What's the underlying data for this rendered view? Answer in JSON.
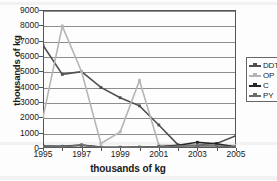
{
  "chart_data": {
    "type": "line",
    "title": "",
    "xlabel": "thousands of kg",
    "ylabel": "thousands of kg",
    "x": [
      1995,
      1996,
      1997,
      1998,
      1999,
      2000,
      2001,
      2002,
      2003,
      2004,
      2005
    ],
    "xlim": [
      1995,
      2005
    ],
    "ylim": [
      0,
      9000
    ],
    "ytick_values": [
      0,
      1000,
      2000,
      3000,
      4000,
      5000,
      6000,
      7000,
      8000,
      9000
    ],
    "ytick_labels": [
      "0",
      "1000",
      "2000",
      "3000",
      "4000",
      "5000",
      "6000",
      "7000",
      "8000",
      "9000"
    ],
    "xtick_values": [
      1995,
      1997,
      1999,
      2001,
      2003,
      2005
    ],
    "xtick_labels": [
      "1995",
      "1997",
      "1999",
      "2001",
      "2003",
      "2005"
    ],
    "grid": "horizontal",
    "legend_position": "right",
    "series": [
      {
        "name": "DDT",
        "color": "#4f4f4f",
        "values": [
          6700,
          4800,
          4980,
          3950,
          3280,
          2750,
          1500,
          200,
          180,
          300,
          800
        ]
      },
      {
        "name": "OP",
        "color": "#b5b5b5",
        "values": [
          2000,
          7950,
          4980,
          300,
          1050,
          4400,
          200,
          170,
          150,
          200,
          160
        ]
      },
      {
        "name": "C",
        "color": "#262626",
        "values": [
          130,
          110,
          200,
          60,
          50,
          60,
          80,
          180,
          370,
          280,
          60
        ]
      },
      {
        "name": "PY",
        "color": "#6b6b6b",
        "values": [
          100,
          90,
          170,
          40,
          30,
          40,
          60,
          120,
          150,
          130,
          70
        ]
      }
    ]
  },
  "legend": {
    "items": [
      {
        "label": "DDT"
      },
      {
        "label": "OP"
      },
      {
        "label": "C"
      },
      {
        "label": "PY"
      }
    ]
  }
}
